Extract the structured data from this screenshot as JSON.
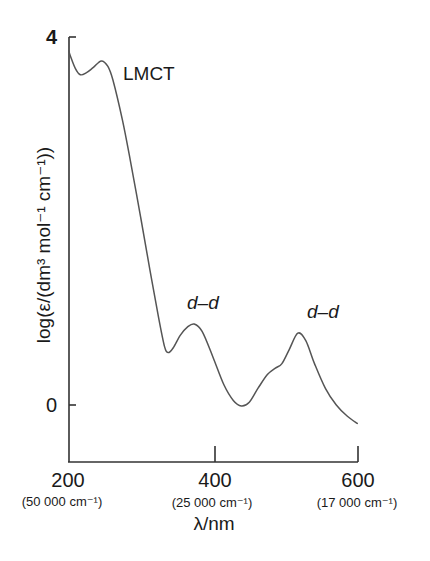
{
  "chart_data": {
    "type": "line",
    "title": "",
    "xlabel": "λ/nm",
    "ylabel": "log(ε/(dm³ mol⁻¹ cm⁻¹))",
    "xlim": [
      200,
      600
    ],
    "ylim": [
      -0.6,
      4
    ],
    "grid": false,
    "legend": null,
    "x_ticks": [
      {
        "value": 200,
        "label": "200",
        "sublabel": "(50 000 cm⁻¹)"
      },
      {
        "value": 400,
        "label": "400",
        "sublabel": "(25 000 cm⁻¹)"
      },
      {
        "value": 600,
        "label": "600",
        "sublabel": "(17 000 cm⁻¹)"
      }
    ],
    "y_ticks": [
      {
        "value": 0,
        "label": "0"
      },
      {
        "value": 4,
        "label": "4"
      }
    ],
    "series": [
      {
        "name": "absorption spectrum",
        "x": [
          201,
          203,
          210,
          217,
          225,
          235,
          246,
          255,
          262,
          275,
          286,
          300,
          313,
          325,
          333,
          338,
          345,
          355,
          365,
          374,
          385,
          400,
          415,
          428,
          439,
          450,
          462,
          475,
          486,
          495,
          505,
          517,
          528,
          540,
          555,
          570,
          585,
          599
        ],
        "y": [
          3.85,
          3.8,
          3.66,
          3.59,
          3.61,
          3.67,
          3.74,
          3.68,
          3.53,
          3.1,
          2.66,
          2.05,
          1.47,
          0.95,
          0.64,
          0.57,
          0.62,
          0.76,
          0.85,
          0.88,
          0.8,
          0.52,
          0.22,
          0.05,
          -0.01,
          0.03,
          0.18,
          0.33,
          0.4,
          0.45,
          0.6,
          0.78,
          0.7,
          0.45,
          0.18,
          0.0,
          -0.12,
          -0.2
        ]
      }
    ],
    "annotations": [
      {
        "text": "LMCT",
        "x": 275,
        "y": 3.55,
        "style": "normal"
      },
      {
        "text": "d–d",
        "x": 374,
        "y": 1.02,
        "style": "italic"
      },
      {
        "text": "d–d",
        "x": 517,
        "y": 0.92,
        "style": "italic"
      }
    ]
  },
  "labels": {
    "y_tick_top": "4",
    "y_tick_zero": "0",
    "x_tick_200": "200",
    "x_tick_400": "400",
    "x_tick_600": "600",
    "x_sub_200": "(50 000 cm⁻¹)",
    "x_sub_400": "(25 000 cm⁻¹)",
    "x_sub_600": "(17 000 cm⁻¹)",
    "x_axis_title": "λ/nm",
    "y_axis_title": "log(ε/(dm³ mol⁻¹ cm⁻¹))",
    "annot_lmct": "LMCT",
    "annot_dd_1": "d–d",
    "annot_dd_2": "d–d"
  },
  "colors": {
    "line": "#555555",
    "axis": "#333333",
    "text": "#1a1a1a"
  }
}
